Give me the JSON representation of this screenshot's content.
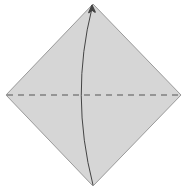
{
  "diagram": {
    "type": "origami-step",
    "colors": {
      "paper_fill": "#d6d6d6",
      "paper_edge": "#9a9a9a",
      "fold_line": "#555555",
      "arrow": "#444444",
      "background": "#ffffff"
    },
    "paper": {
      "shape": "diamond",
      "vertices": {
        "top": [
          93,
          4
        ],
        "right": [
          181,
          95
        ],
        "bottom": [
          93,
          186
        ],
        "left": [
          6,
          95
        ]
      }
    },
    "fold_line": {
      "style": "valley-dashed",
      "from": [
        6,
        95
      ],
      "to": [
        181,
        95
      ]
    },
    "arrow": {
      "kind": "fold-up",
      "from": "bottom-corner",
      "to": "top-corner",
      "path_hint": "curved left of center"
    }
  }
}
